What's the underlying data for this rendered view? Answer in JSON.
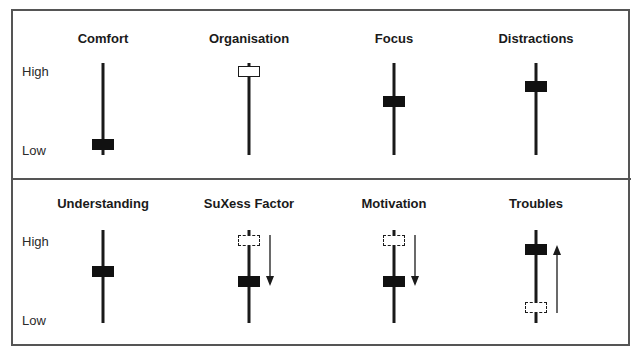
{
  "axis": {
    "high_label": "High",
    "low_label": "Low"
  },
  "top_row": [
    {
      "title": "Comfort",
      "x": 103,
      "title_y": 31,
      "knob_y": 139,
      "style": "solid"
    },
    {
      "title": "Organisation",
      "x": 249,
      "title_y": 31,
      "knob_y": 66,
      "style": "open"
    },
    {
      "title": "Focus",
      "x": 394,
      "title_y": 31,
      "knob_y": 96,
      "style": "solid"
    },
    {
      "title": "Distractions",
      "x": 536,
      "title_y": 31,
      "knob_y": 81,
      "style": "solid"
    }
  ],
  "bottom_row": [
    {
      "title": "Understanding",
      "x": 103,
      "title_y": 196,
      "knob_y": 266,
      "style": "solid"
    },
    {
      "title": "SuXess Factor",
      "x": 249,
      "title_y": 196,
      "knob_y": 276,
      "style": "solid",
      "ghost_y": 235,
      "arrow": "down",
      "arrow_x": 270,
      "arrow_from": 235,
      "arrow_to": 286
    },
    {
      "title": "Motivation",
      "x": 394,
      "title_y": 196,
      "knob_y": 276,
      "style": "solid",
      "ghost_y": 235,
      "arrow": "down",
      "arrow_x": 415,
      "arrow_from": 235,
      "arrow_to": 286
    },
    {
      "title": "Troubles",
      "x": 536,
      "title_y": 196,
      "knob_y": 244,
      "style": "solid",
      "ghost_y": 302,
      "arrow": "up",
      "arrow_x": 557,
      "arrow_from": 313,
      "arrow_to": 245
    }
  ],
  "chart_data": {
    "type": "slider-comparison",
    "scale": [
      "Low",
      "High"
    ],
    "panels": [
      {
        "name": "before",
        "items": [
          {
            "label": "Comfort",
            "level": "low",
            "value": 0.1
          },
          {
            "label": "Organisation",
            "level": "high",
            "value": 0.95,
            "marker": "open"
          },
          {
            "label": "Focus",
            "level": "medium",
            "value": 0.6
          },
          {
            "label": "Distractions",
            "level": "medium-high",
            "value": 0.75
          }
        ]
      },
      {
        "name": "after",
        "items": [
          {
            "label": "Understanding",
            "level": "medium",
            "value": 0.55
          },
          {
            "label": "SuXess Factor",
            "from": 0.9,
            "to": 0.45,
            "direction": "down"
          },
          {
            "label": "Motivation",
            "from": 0.9,
            "to": 0.45,
            "direction": "down"
          },
          {
            "label": "Troubles",
            "from": 0.15,
            "to": 0.8,
            "direction": "up"
          }
        ]
      }
    ]
  }
}
